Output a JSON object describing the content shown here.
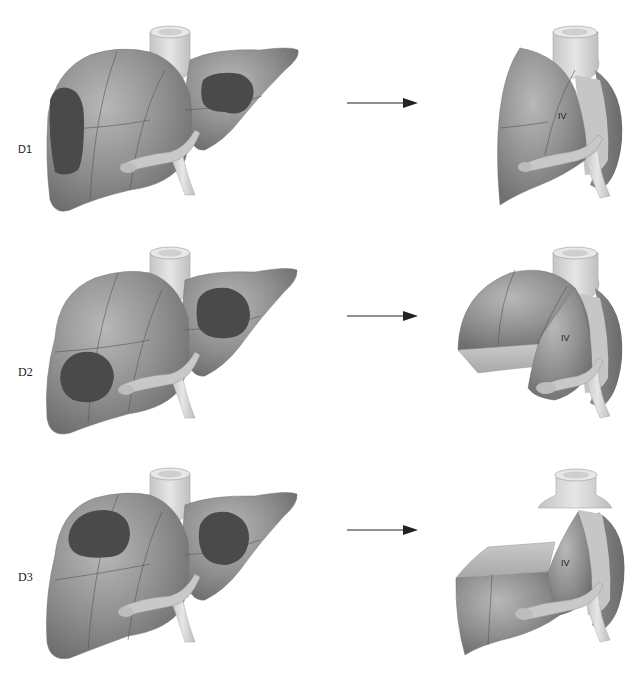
{
  "figure": {
    "rows": [
      {
        "id": "D1",
        "label": "D1",
        "label_font": "sans",
        "result_segment_label": "IV",
        "tumor_description": "Right lateral lesion and left lobe lesion"
      },
      {
        "id": "D2",
        "label": "D2",
        "label_font": "serif",
        "result_segment_label": "IV",
        "tumor_description": "Right inferior lesion and left lobe lesion"
      },
      {
        "id": "D3",
        "label": "D3",
        "label_font": "serif",
        "result_segment_label": "IV",
        "tumor_description": "Right superior lesion and left lobe lesion"
      }
    ],
    "arrow": "right-arrow",
    "colors": {
      "parenchyma": "#8c8c8c",
      "parenchyma_light": "#b4b4b4",
      "tumor": "#4a4a4a",
      "vessel": "#d8d8d8",
      "segment_line": "#555555",
      "background": "#ffffff"
    }
  }
}
